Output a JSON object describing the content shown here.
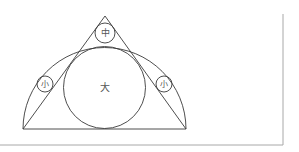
{
  "diagram": {
    "labels": {
      "large": "大",
      "medium": "中",
      "small_left": "小",
      "small_right": "小"
    },
    "colors": {
      "line": "#3a3a3a",
      "frame": "#a8a8a8",
      "text": "#555555",
      "background": "#ffffff"
    },
    "shapes": {
      "triangle": {
        "apex": [
          105,
          16
        ],
        "base_left": [
          23,
          129
        ],
        "base_right": [
          186,
          129
        ]
      },
      "semicircle": {
        "center": [
          104.5,
          129
        ],
        "radius": 81.5
      },
      "large_circle": {
        "center": [
          104.5,
          87.5
        ],
        "radius": 41
      },
      "medium_circle": {
        "center": [
          105,
          33
        ],
        "radius": 10
      },
      "small_circle_left": {
        "center": [
          45,
          84
        ],
        "radius": 8
      },
      "small_circle_right": {
        "center": [
          164,
          84
        ],
        "radius": 8
      }
    }
  }
}
